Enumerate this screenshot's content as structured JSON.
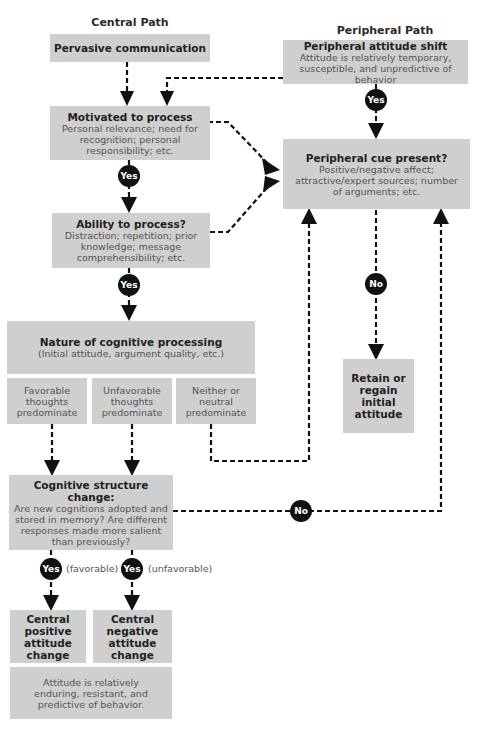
{
  "headers": {
    "central": "Central Path",
    "peripheral": "Peripheral Path"
  },
  "boxes": {
    "pervasive": {
      "title": "Pervasive communication"
    },
    "motivated": {
      "title": "Motivated to process",
      "desc": "Personal relevance; need for recognition; personal responsibility; etc."
    },
    "ability": {
      "title": "Ability to process?",
      "desc": "Distraction; repetition; prior knowledge; message comprehensibility; etc."
    },
    "nature": {
      "title": "Nature of cognitive processing",
      "desc": "(Initial attitude, argument quality, etc.)"
    },
    "favorable": {
      "text": "Favorable thoughts predominate"
    },
    "unfavorable": {
      "text": "Unfavorable thoughts predominate"
    },
    "neither": {
      "text": "Neither or neutral predominate"
    },
    "cognitive": {
      "title": "Cognitive structure change:",
      "desc": "Are new cognitions adopted and stored in memory? Are different responses made more salient than previously?"
    },
    "central_positive": {
      "title": "Central positive attitude change"
    },
    "central_negative": {
      "title": "Central negative attitude change"
    },
    "enduring": {
      "text": "Attitude is relatively enduring, resistant, and predictive of behavior."
    },
    "peripheral_shift": {
      "title": "Peripheral attitude shift",
      "desc": "Attitude is relatively temporary, susceptible, and unpredictive of behavior"
    },
    "peripheral_cue": {
      "title": "Peripheral cue present?",
      "desc": "Positive/negative affect; attractive/expert sources; number of arguments; etc."
    },
    "retain": {
      "title": "Retain or regain initial attitude"
    }
  },
  "badges": {
    "yes": "Yes",
    "no": "No"
  },
  "labels": {
    "favorable": "(favorable)",
    "unfavorable": "(unfavorable)"
  },
  "colors": {
    "box_fill": "#cfcfcf",
    "badge_fill": "#111111",
    "line": "#111111"
  }
}
